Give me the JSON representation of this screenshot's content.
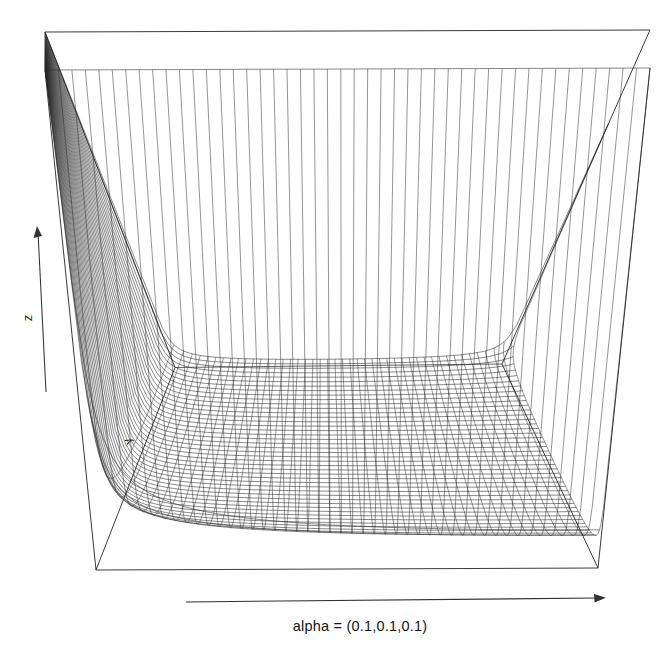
{
  "figure": {
    "kind": "3d-wireframe-surface",
    "background_color": "#ffffff",
    "line_color": "#242424",
    "box_color": "#3a3a3a",
    "width": 668,
    "height": 658
  },
  "axes": {
    "x": {
      "label": "alpha = (0.1,0.1,0.1)",
      "arrow": "right-arrow-icon",
      "label_x": 360,
      "label_y": 625
    },
    "y": {
      "label": "y",
      "rotated": true,
      "label_x": 131,
      "label_y": 440
    },
    "z": {
      "label": "z",
      "rotated": true,
      "arrow": "up-arrow-icon",
      "label_x": 32,
      "label_y": 318
    }
  },
  "chart_data": {
    "type": "line",
    "subtype": "3d-wireframe-surface",
    "title": "",
    "subtitle": "",
    "xlabel": "alpha = (0.1,0.1,0.1)",
    "ylabel": "y",
    "zlabel": "z",
    "grid": false,
    "legend": null,
    "annotations": [
      "alpha = (0.1,0.1,0.1)",
      "z",
      "y"
    ],
    "surface": {
      "function": "dirichlet-density",
      "alpha": [
        0.1,
        0.1,
        0.1
      ],
      "description": "Dirichlet(0.1,0.1,0.1) probability density over the 2-simplex rendered as a perspective wireframe; density diverges to large values along the simplex boundary and at the corners, forming a deep U/bowl shaped valley in the interior.",
      "nx": 46,
      "ny": 46,
      "xlim": [
        0,
        1
      ],
      "ylim": [
        0,
        1
      ],
      "zlim": [
        0,
        1
      ],
      "x_tick_labels": [],
      "y_tick_labels": [],
      "z_tick_labels": []
    },
    "projection": {
      "box_top_left": [
        45,
        32
      ],
      "box_top_right": [
        650,
        30
      ],
      "box_back_corner": [
        502,
        364
      ],
      "box_bottom_front_left": [
        96,
        570
      ],
      "box_bottom_front_right": [
        598,
        568
      ],
      "box_left_interior_vertical_x": 175,
      "box_right_interior_vertical_x": 638
    }
  }
}
